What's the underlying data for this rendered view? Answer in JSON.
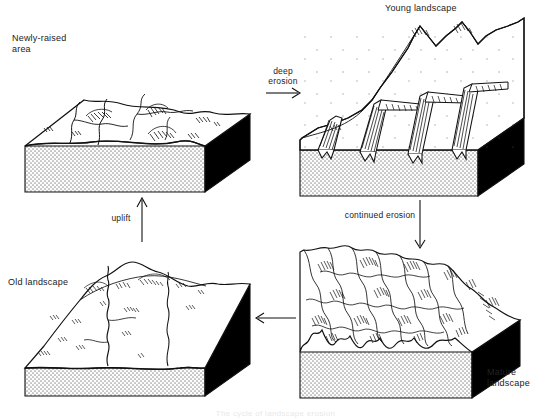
{
  "figure": {
    "title": "The cycle of landscape erosion",
    "background_color": "#ffffff",
    "line_color": "#111111",
    "base_fill_color": "#d8d8d8",
    "shadow_face_color": "#000000"
  },
  "blocks": [
    {
      "id": "newly-raised",
      "label": "Newly-raised\narea",
      "label_position": "top-left-outside",
      "stage": 1,
      "description": "Flat, newly uplifted plateau with shallow stream channels"
    },
    {
      "id": "young-landscape",
      "label": "Young landscape",
      "label_position": "top-center-outside",
      "stage": 2,
      "description": "Deep V-shaped canyons cut into a high plateau surface"
    },
    {
      "id": "mature-landscape",
      "label": "Mature\nlandscape",
      "label_position": "bottom-right-outside",
      "stage": 3,
      "description": "Fully dissected terrain of sharp ridges and branching valleys"
    },
    {
      "id": "old-landscape",
      "label": "Old landscape",
      "label_position": "mid-left-outside",
      "stage": 4,
      "description": "Worn-down low relief plain with broad meandering river"
    }
  ],
  "arrows": [
    {
      "id": "deep-erosion",
      "label": "deep\nerosion",
      "direction": "right"
    },
    {
      "id": "continued-erosion",
      "label": "continued erosion",
      "direction": "down"
    },
    {
      "id": "return-flow",
      "label": "",
      "direction": "left"
    },
    {
      "id": "uplift",
      "label": "uplift",
      "direction": "up"
    }
  ]
}
